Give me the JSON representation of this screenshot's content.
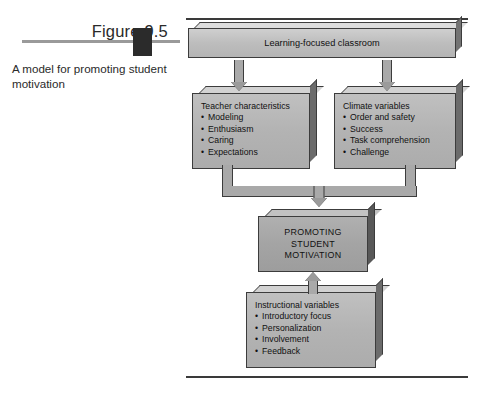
{
  "figure": {
    "number": "Figure 9.5",
    "caption": "A model for promoting student motivation",
    "marker_icon": "figure-marker-block",
    "rule_color": "#9a9a9a"
  },
  "diagram": {
    "title": "A model for promoting student motivation",
    "colors": {
      "box_face_light": "#b3b3b3",
      "box_face_mid": "#a4a4a4",
      "box_bevel_top": "#d2d2d2",
      "box_side": "#6b6b6b",
      "outline": "#3c3c3c",
      "arrow_fill": "#a9a9a9",
      "rule": "#3a3a3a"
    },
    "boxes": {
      "classroom": {
        "title": "Learning-focused classroom",
        "items": []
      },
      "teacher": {
        "title": "Teacher characteristics",
        "items": [
          "Modeling",
          "Enthusiasm",
          "Caring",
          "Expectations"
        ]
      },
      "climate": {
        "title": "Climate variables",
        "items": [
          "Order and safety",
          "Success",
          "Task comprehension",
          "Challenge"
        ]
      },
      "promoting": {
        "line1": "PROMOTING",
        "line2": "STUDENT",
        "line3": "MOTIVATION"
      },
      "instructional": {
        "title": "Instructional variables",
        "items": [
          "Introductory focus",
          "Personalization",
          "Involvement",
          "Feedback"
        ]
      }
    },
    "arrows": [
      {
        "name": "classroom-to-teacher",
        "direction": "down"
      },
      {
        "name": "classroom-to-climate",
        "direction": "down"
      },
      {
        "name": "teacher-climate-merge-to-promoting",
        "direction": "down"
      },
      {
        "name": "instructional-to-promoting",
        "direction": "up"
      }
    ]
  }
}
